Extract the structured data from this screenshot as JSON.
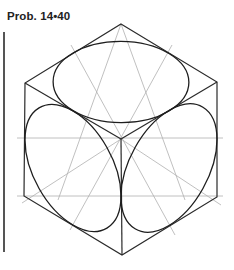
{
  "figure": {
    "label": "Prob. 14•40",
    "colors": {
      "object_lines": "#2a2a2a",
      "construction_lines": "#b0b0b0",
      "text": "#222222",
      "background": "#ffffff"
    },
    "elements": [
      {
        "name": "hexagon-outline",
        "type": "isometric cube outline"
      },
      {
        "name": "top-face-ellipse",
        "type": "isometric circle"
      },
      {
        "name": "left-face-ellipse",
        "type": "isometric circle"
      },
      {
        "name": "right-face-ellipse",
        "type": "isometric circle"
      },
      {
        "name": "construction-lines",
        "type": "light guide lines"
      }
    ]
  }
}
